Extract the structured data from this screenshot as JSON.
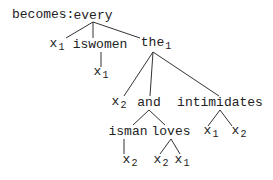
{
  "prefix": "becomes: ",
  "nodes": [
    {
      "id": "every",
      "text": "every",
      "sub": "",
      "x": 93,
      "y": 16
    },
    {
      "id": "x1a",
      "text": "x",
      "sub": "1",
      "x": 57,
      "y": 46
    },
    {
      "id": "iswomen",
      "text": "iswomen",
      "sub": "",
      "x": 100,
      "y": 45
    },
    {
      "id": "the1",
      "text": "the",
      "sub": "1",
      "x": 156,
      "y": 45
    },
    {
      "id": "x1b",
      "text": "x",
      "sub": "1",
      "x": 101,
      "y": 74
    },
    {
      "id": "x2a",
      "text": "x",
      "sub": "2",
      "x": 119,
      "y": 104
    },
    {
      "id": "and",
      "text": "and",
      "sub": "",
      "x": 149,
      "y": 103
    },
    {
      "id": "intimidates",
      "text": "intimidates",
      "sub": "",
      "x": 220,
      "y": 103
    },
    {
      "id": "isman",
      "text": "isman",
      "sub": "",
      "x": 128,
      "y": 132
    },
    {
      "id": "loves",
      "text": "loves",
      "sub": "",
      "x": 171,
      "y": 132
    },
    {
      "id": "x1c",
      "text": "x",
      "sub": "1",
      "x": 211,
      "y": 133
    },
    {
      "id": "x2b",
      "text": "x",
      "sub": "2",
      "x": 239,
      "y": 133
    },
    {
      "id": "x2c",
      "text": "x",
      "sub": "2",
      "x": 130,
      "y": 162
    },
    {
      "id": "x2d",
      "text": "x",
      "sub": "2",
      "x": 161,
      "y": 162
    },
    {
      "id": "x1d",
      "text": "x",
      "sub": "1",
      "x": 182,
      "y": 162
    }
  ],
  "edges": [
    [
      93,
      22,
      66,
      38
    ],
    [
      93,
      22,
      93,
      38
    ],
    [
      93,
      22,
      140,
      38
    ],
    [
      101,
      52,
      101,
      67
    ],
    [
      153,
      52,
      124,
      96
    ],
    [
      153,
      52,
      150,
      96
    ],
    [
      153,
      52,
      219,
      96
    ],
    [
      149,
      110,
      133,
      125
    ],
    [
      149,
      110,
      165,
      125
    ],
    [
      220,
      110,
      208,
      126
    ],
    [
      220,
      110,
      232,
      126
    ],
    [
      124,
      139,
      124,
      154
    ],
    [
      171,
      139,
      160,
      154
    ],
    [
      171,
      139,
      180,
      154
    ]
  ]
}
